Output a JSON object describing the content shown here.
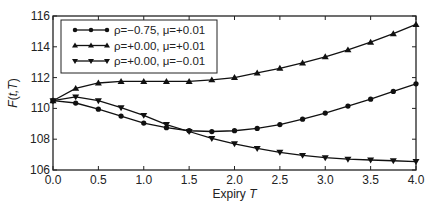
{
  "chart_data": {
    "type": "line",
    "title": "",
    "xlabel": "Expiry T",
    "ylabel": "F(t,T)",
    "xlim": [
      0.0,
      4.0
    ],
    "ylim": [
      106,
      116
    ],
    "xticks": [
      "0.0",
      "0.5",
      "1.0",
      "1.5",
      "2.0",
      "2.5",
      "3.0",
      "3.5",
      "4.0"
    ],
    "yticks": [
      "106",
      "108",
      "110",
      "112",
      "114",
      "116"
    ],
    "grid": false,
    "legend_position": "upper left",
    "x": [
      0.0,
      0.25,
      0.5,
      0.75,
      1.0,
      1.25,
      1.5,
      1.75,
      2.0,
      2.25,
      2.5,
      2.75,
      3.0,
      3.25,
      3.5,
      3.75,
      4.0
    ],
    "series": [
      {
        "name": "ρ=−0.75, μ=+0.01",
        "marker": "circle",
        "values": [
          110.5,
          110.35,
          109.95,
          109.5,
          109.05,
          108.75,
          108.55,
          108.5,
          108.55,
          108.7,
          108.95,
          109.3,
          109.7,
          110.15,
          110.6,
          111.1,
          111.6
        ]
      },
      {
        "name": "ρ=+0.00, μ=+0.01",
        "marker": "triangle-up",
        "values": [
          110.5,
          111.3,
          111.65,
          111.75,
          111.75,
          111.75,
          111.75,
          111.85,
          112.0,
          112.3,
          112.6,
          112.95,
          113.35,
          113.8,
          114.3,
          114.85,
          115.45
        ]
      },
      {
        "name": "ρ=+0.00, μ=−0.01",
        "marker": "triangle-down",
        "values": [
          110.5,
          110.75,
          110.5,
          110.05,
          109.55,
          108.95,
          108.5,
          108.05,
          107.7,
          107.4,
          107.15,
          106.95,
          106.8,
          106.7,
          106.65,
          106.6,
          106.55
        ]
      }
    ]
  }
}
